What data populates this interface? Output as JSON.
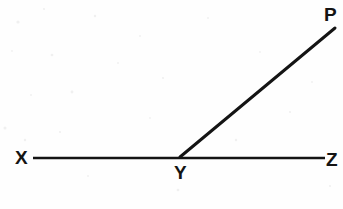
{
  "figure": {
    "type": "geometry-diagram",
    "background_color": "#fefefe",
    "stroke_color": "#141414"
  },
  "labels": {
    "x": "X",
    "y": "Y",
    "z": "Z",
    "p": "P"
  },
  "points": {
    "X": {
      "x": 33,
      "y": 158
    },
    "Y": {
      "x": 180,
      "y": 157
    },
    "Z": {
      "x": 325,
      "y": 158
    },
    "P": {
      "x": 335,
      "y": 28
    }
  },
  "segments": [
    {
      "name": "line-XZ",
      "from": "X",
      "to": "Z",
      "x1": 33,
      "y1": 158,
      "x2": 325,
      "y2": 158,
      "stroke_width": 2.6
    },
    {
      "name": "ray-YP",
      "from": "Y",
      "to": "P",
      "x1": 180,
      "y1": 157,
      "x2": 335,
      "y2": 28,
      "stroke_width": 3.0
    }
  ]
}
